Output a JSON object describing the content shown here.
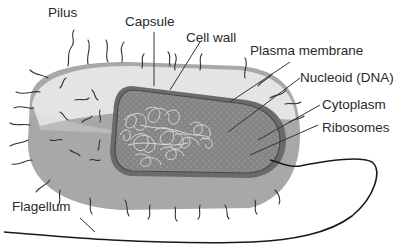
{
  "labels": {
    "pilus": "Pilus",
    "capsule": "Capsule",
    "cell_wall": "Cell wall",
    "plasma_membrane": "Plasma membrane",
    "nucleoid": "Nucleoid (DNA)",
    "cytoplasm": "Cytoplasm",
    "ribosomes": "Ribosomes",
    "flagellum": "Flagellum"
  },
  "colors": {
    "capsule_top": "#e6e6e6",
    "capsule_side": "#a8a8a8",
    "cell_wall": "#707070",
    "cytoplasm": "#858585",
    "dna": "#e0e0e0",
    "lines": "#333333",
    "text": "#2a2a2a"
  }
}
